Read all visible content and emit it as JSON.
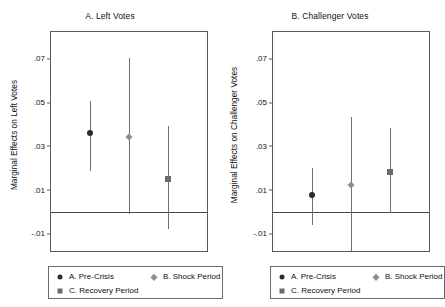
{
  "chart_data": {
    "type": "scatter",
    "title": "",
    "panels": [
      {
        "title": "A. Left Votes",
        "ylabel": "Marginal Effects on Left Votes",
        "xlabel": "",
        "ylim": [
          -0.018,
          0.082
        ],
        "yticks": [
          0.07,
          0.05,
          0.03,
          0.01,
          -0.01
        ],
        "ytick_labels": [
          ".07",
          ".05",
          ".03",
          ".01",
          "-.01"
        ],
        "zero_line": 0,
        "grid": false,
        "categories": [
          "A. Pre-Crisis",
          "B. Shock Period",
          "C. Recovery Period"
        ],
        "values": [
          0.036,
          0.034,
          0.0151
        ],
        "ci_low": [
          0.0185,
          -0.001,
          -0.008
        ],
        "ci_high": [
          0.0505,
          0.07,
          0.039
        ],
        "markers": [
          "circle",
          "diamond",
          "square"
        ]
      },
      {
        "title": "B. Challenger Votes",
        "ylabel": "Marginal Effects on Challenger Votes",
        "xlabel": "",
        "ylim": [
          -0.018,
          0.082
        ],
        "yticks": [
          0.07,
          0.05,
          0.03,
          0.01,
          -0.01
        ],
        "ytick_labels": [
          ".07",
          ".05",
          ".03",
          ".01",
          "-.01"
        ],
        "zero_line": 0,
        "grid": false,
        "categories": [
          "A. Pre-Crisis",
          "B. Shock Period",
          "C. Recovery Period"
        ],
        "values": [
          0.0075,
          0.0122,
          0.0181
        ],
        "ci_low": [
          -0.006,
          -0.018,
          -0.0005
        ],
        "ci_high": [
          0.02,
          0.043,
          0.038
        ],
        "markers": [
          "circle",
          "diamond",
          "square"
        ]
      }
    ],
    "legend": {
      "position": "bottom",
      "entries": [
        {
          "label": "A. Pre-Crisis",
          "marker": "circle",
          "color": "#2b2b2b"
        },
        {
          "label": "B. Shock Period",
          "marker": "diamond",
          "color": "#8e8e8e"
        },
        {
          "label": "C. Recovery Period",
          "marker": "square",
          "color": "#6b6b6b"
        }
      ]
    }
  },
  "panel_a": {
    "title": "A. Left Votes",
    "ylabel": "Marginal Effects on Left Votes",
    "ticks": {
      "t0": ".07",
      "t1": ".05",
      "t2": ".03",
      "t3": ".01",
      "t4": "-.01"
    },
    "legend": {
      "item1": "A. Pre-Crisis",
      "item2": "B. Shock Period",
      "item3": "C. Recovery Period"
    }
  },
  "panel_b": {
    "title": "B. Challenger Votes",
    "ylabel": "Marginal Effects on Challenger Votes",
    "ticks": {
      "t0": ".07",
      "t1": ".05",
      "t2": ".03",
      "t3": ".01",
      "t4": "-.01"
    },
    "legend": {
      "item1": "A. Pre-Crisis",
      "item2": "B. Shock Period",
      "item3": "C. Recovery Period"
    }
  }
}
